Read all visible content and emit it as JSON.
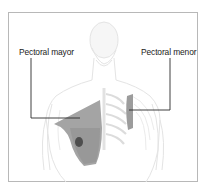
{
  "diagram": {
    "labels": [
      {
        "id": "pectoral-mayor",
        "text": "Pectoral mayor"
      },
      {
        "id": "pectoral-menor",
        "text": "Pectoral menor"
      }
    ],
    "colors": {
      "frame": "#b8b8b8",
      "leader_line": "#2a2a2a",
      "muscle_fill": "#9a9a9a",
      "muscle_dark": "#5a5a5a",
      "body_outline": "#e6e6e6"
    }
  }
}
